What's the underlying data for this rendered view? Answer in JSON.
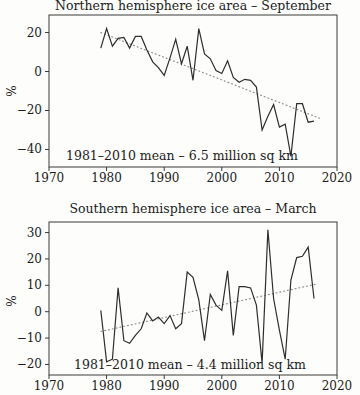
{
  "figure": {
    "description_colors": {
      "background": "#fdfdfb",
      "axis": "#3a3a3a",
      "data_line": "#2e2e2e",
      "trend_line": "#8f8f8f",
      "text": "#1c1c1c"
    }
  },
  "chart_data": [
    {
      "type": "line",
      "title": "Northern hemisphere ice area – September",
      "ylabel": "%",
      "annotation": "1981–2010 mean – 6.5 million sq km",
      "legend": "none",
      "grid": false,
      "xlim": [
        1970,
        2020
      ],
      "ylim": [
        -49,
        29
      ],
      "xticks": [
        1970,
        1980,
        1990,
        2000,
        2010,
        2020
      ],
      "xtick_labels": [
        "1970",
        "1980",
        "1990",
        "2000",
        "2010",
        "2020"
      ],
      "yticks": [
        20,
        0,
        -20,
        -40
      ],
      "ytick_labels": [
        "20",
        "0",
        "−20",
        "−40"
      ],
      "x": [
        1979,
        1980,
        1981,
        1982,
        1983,
        1984,
        1985,
        1986,
        1987,
        1988,
        1989,
        1990,
        1991,
        1992,
        1993,
        1994,
        1995,
        1996,
        1997,
        1998,
        1999,
        2000,
        2001,
        2002,
        2003,
        2004,
        2005,
        2006,
        2007,
        2008,
        2009,
        2010,
        2011,
        2012,
        2013,
        2014,
        2015,
        2016
      ],
      "values": [
        12,
        22,
        13,
        17,
        17.5,
        12,
        18,
        18,
        11,
        5,
        2,
        -2,
        7,
        16.5,
        4,
        13,
        -4.5,
        22,
        9,
        6.5,
        0.5,
        -1,
        5.5,
        -3,
        -5.5,
        -4,
        -4.5,
        -8,
        -30,
        -23,
        -17,
        -28.5,
        -27,
        -43.5,
        -16.5,
        -16.5,
        -26,
        -25.5
      ],
      "trend": {
        "x": [
          1979,
          2017
        ],
        "y": [
          20,
          -24
        ]
      },
      "line_color": "#2e2e2e",
      "trend_color": "#8f8f8f"
    },
    {
      "type": "line",
      "title": "Southern hemisphere ice area – March",
      "ylabel": "%",
      "annotation": "1981–2010 mean – 4.4 million sq km",
      "legend": "none",
      "grid": false,
      "xlim": [
        1970,
        2020
      ],
      "ylim": [
        -24,
        34
      ],
      "xticks": [
        1970,
        1980,
        1990,
        2000,
        2010,
        2020
      ],
      "xtick_labels": [
        "1970",
        "1980",
        "1990",
        "2000",
        "2010",
        "2020"
      ],
      "yticks": [
        30,
        20,
        10,
        0,
        -10,
        -20
      ],
      "ytick_labels": [
        "30",
        "20",
        "10",
        "0",
        "−10",
        "−20"
      ],
      "x": [
        1979,
        1980,
        1981,
        1982,
        1983,
        1984,
        1985,
        1986,
        1987,
        1988,
        1989,
        1990,
        1991,
        1992,
        1993,
        1994,
        1995,
        1996,
        1997,
        1998,
        1999,
        2000,
        2001,
        2002,
        2003,
        2004,
        2005,
        2006,
        2007,
        2008,
        2009,
        2010,
        2011,
        2012,
        2013,
        2014,
        2015,
        2016
      ],
      "values": [
        0.5,
        -19,
        -18,
        9,
        -11,
        -12,
        -9,
        -6.5,
        -0.5,
        -3.5,
        -2,
        -4.5,
        -1.5,
        -6.5,
        -4.5,
        15,
        13,
        4.5,
        -11,
        6.5,
        2.5,
        0.5,
        15.5,
        -9,
        9.5,
        9.5,
        9,
        2.5,
        -19.5,
        31,
        5,
        -7,
        -18,
        12,
        20.5,
        21,
        24.5,
        5
      ],
      "trend": {
        "x": [
          1979,
          2016.5
        ],
        "y": [
          -7.5,
          10.5
        ]
      },
      "line_color": "#2e2e2e",
      "trend_color": "#8f8f8f"
    }
  ]
}
